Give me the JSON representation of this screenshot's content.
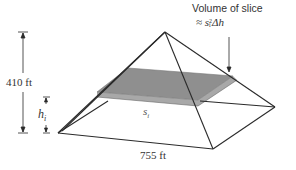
{
  "diagram": {
    "labels": {
      "height": "410 ft",
      "base": "755 ft",
      "slice_height": "h",
      "slice_height_sub": "i",
      "slice_side": "s",
      "slice_side_sub": "i",
      "annotation_title": "Volume of slice",
      "annotation_formula_prefix": "≈ s",
      "annotation_formula_sub": "i",
      "annotation_formula_sup": "2",
      "annotation_formula_suffix": "Δh"
    },
    "colors": {
      "line": "#2a2a2a",
      "slice_fill": "#9a9a9a",
      "slice_edge": "#7d7d7d",
      "text": "#333333"
    }
  }
}
